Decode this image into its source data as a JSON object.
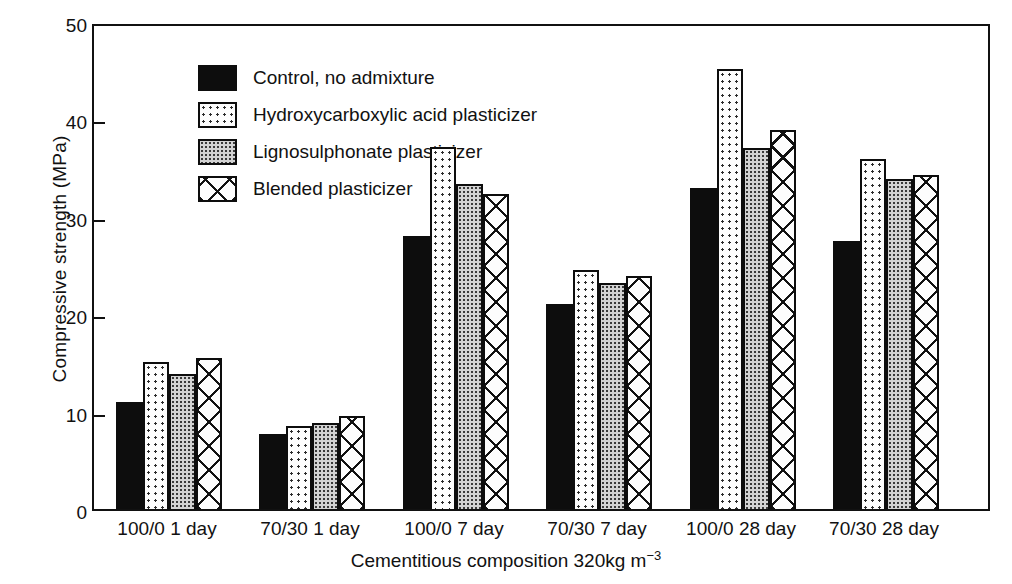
{
  "chart_data": {
    "type": "bar",
    "title": "",
    "xlabel": "Cementitious composition 320kg m",
    "xlabel_sup": "−3",
    "ylabel": "Compressive strength (MPa)",
    "ylim": [
      0,
      50
    ],
    "yticks": [
      0,
      10,
      20,
      30,
      40,
      50
    ],
    "ytick_labels": [
      "0",
      "10",
      "20",
      "30",
      "40",
      "50"
    ],
    "grid": false,
    "legend_position": "upper-left-inside",
    "categories": [
      "100/0 1 day",
      "70/30 1 day",
      "100/0 7 day",
      "70/30 7 day",
      "100/0 28 day",
      "70/30 28 day"
    ],
    "series": [
      {
        "name": "Control, no admixture",
        "pattern": "solid-black",
        "values": [
          11.0,
          7.7,
          28.0,
          21.0,
          33.0,
          27.5
        ]
      },
      {
        "name": "Hydroxycarboxylic acid plasticizer",
        "pattern": "sparse-dots",
        "values": [
          15.1,
          8.5,
          37.2,
          24.5,
          45.2,
          35.9
        ]
      },
      {
        "name": "Lignosulphonate plasticizer",
        "pattern": "dense-dots-grey",
        "values": [
          13.9,
          8.8,
          33.4,
          23.2,
          37.1,
          33.9
        ]
      },
      {
        "name": "Blended plasticizer",
        "pattern": "crosshatch",
        "values": [
          15.5,
          9.6,
          32.3,
          23.9,
          38.9,
          34.3
        ]
      }
    ]
  }
}
